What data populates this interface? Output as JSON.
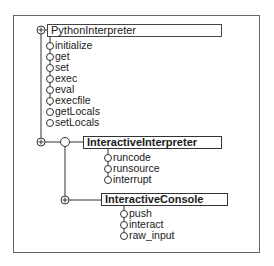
{
  "diagram": {
    "classes": [
      {
        "name": "PythonInterpreter",
        "methods": [
          "initialize",
          "get",
          "set",
          "exec",
          "eval",
          "execfile",
          "getLocals",
          "setLocals"
        ]
      },
      {
        "name": "InteractiveInterpreter",
        "methods": [
          "runcode",
          "runsource",
          "interrupt"
        ]
      },
      {
        "name": "InteractiveConsole",
        "methods": [
          "push",
          "interact",
          "raw_input"
        ]
      }
    ],
    "relations": [
      {
        "from": "InteractiveInterpreter",
        "to": "PythonInterpreter",
        "type": "inherits"
      },
      {
        "from": "InteractiveConsole",
        "to": "InteractiveInterpreter",
        "type": "inherits"
      }
    ],
    "icons": {
      "class_node": "circle-plus-icon",
      "method_node": "circle-icon"
    }
  }
}
